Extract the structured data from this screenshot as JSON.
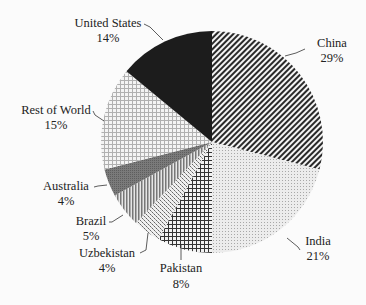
{
  "chart_data": {
    "type": "pie",
    "title": "",
    "start_angle_deg": 0,
    "direction": "clockwise",
    "categories": [
      "China",
      "India",
      "Pakistan",
      "Uzbekistan",
      "Brazil",
      "Australia",
      "Rest of World",
      "United States"
    ],
    "values": [
      29,
      21,
      8,
      4,
      5,
      4,
      15,
      14
    ],
    "value_labels": [
      "29%",
      "21%",
      "8%",
      "4%",
      "5%",
      "4%",
      "15%",
      "14%"
    ],
    "slices": [
      {
        "name": "China",
        "value": 29,
        "pct_label": "29%",
        "pattern": "diagonal-stripes"
      },
      {
        "name": "India",
        "value": 21,
        "pct_label": "21%",
        "pattern": "light-dots"
      },
      {
        "name": "Pakistan",
        "value": 8,
        "pct_label": "8%",
        "pattern": "grid"
      },
      {
        "name": "Uzbekistan",
        "value": 4,
        "pct_label": "4%",
        "pattern": "checker-dots"
      },
      {
        "name": "Brazil",
        "value": 5,
        "pct_label": "5%",
        "pattern": "vertical-stripes"
      },
      {
        "name": "Australia",
        "value": 4,
        "pct_label": "4%",
        "pattern": "dark-gray"
      },
      {
        "name": "Rest of World",
        "value": 15,
        "pct_label": "15%",
        "pattern": "light-grid"
      },
      {
        "name": "United States",
        "value": 14,
        "pct_label": "14%",
        "pattern": "solid-black"
      }
    ],
    "legend": "none (data labels with leader lines)"
  },
  "labels": {
    "china": {
      "name": "China",
      "pct": "29%"
    },
    "india": {
      "name": "India",
      "pct": "21%"
    },
    "pakistan": {
      "name": "Pakistan",
      "pct": "8%"
    },
    "uzbekistan": {
      "name": "Uzbekistan",
      "pct": "4%"
    },
    "brazil": {
      "name": "Brazil",
      "pct": "5%"
    },
    "australia": {
      "name": "Australia",
      "pct": "4%"
    },
    "row": {
      "name": "Rest of World",
      "pct": "15%"
    },
    "us": {
      "name": "United States",
      "pct": "14%"
    }
  }
}
